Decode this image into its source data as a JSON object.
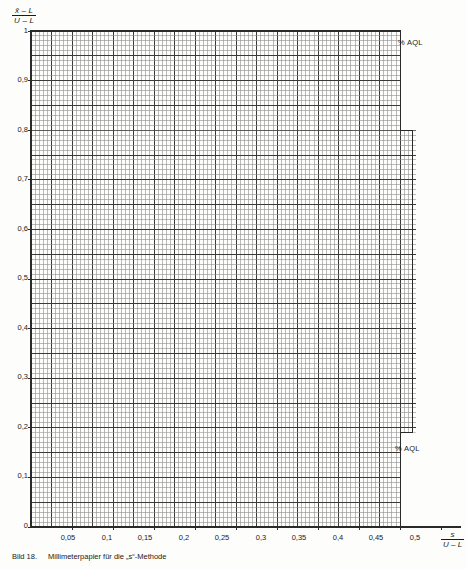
{
  "figure": {
    "caption_id": "Bild 18.",
    "caption_text": "Millimeterpapier für die „s“-Methode"
  },
  "axes": {
    "y_label": {
      "numerator": "x̄ – L",
      "denominator": "U – L"
    },
    "x_label": {
      "numerator": "s",
      "denominator": "U – L"
    },
    "y_ticks": [
      "1",
      "0,9",
      "0,8",
      "0,7",
      "0,6",
      "0,5",
      "0,4",
      "0,3",
      "0,2",
      "0,1",
      "0"
    ],
    "x_ticks": [
      "0,05",
      "0,1",
      "0,15",
      "0,2",
      "0,25",
      "0,3",
      "0,35",
      "0,4",
      "0,45",
      "0,5"
    ]
  },
  "annotations": {
    "aql_top": "% AQL",
    "aql_bottom": "% AQL"
  },
  "colors": {
    "background": "#fdfdfc",
    "grid_minor": "#8d8d8d",
    "grid_major": "#3a3a3a",
    "axis": "#2a2a2a",
    "text": "#1a1a1a"
  },
  "chart_data": {
    "type": "line",
    "title": "Millimeterpapier für die „s“-Methode",
    "subtitle": "",
    "xlabel": "s / (U – L)",
    "ylabel": "(x̄ – L) / (U – L)",
    "xlim": [
      0,
      0.5
    ],
    "ylim": [
      0,
      1
    ],
    "grid": true,
    "grid_minor_step_x": 0.005,
    "grid_minor_step_y": 0.01,
    "grid_major_step_x": 0.025,
    "grid_major_step_y": 0.05,
    "legend": "none",
    "xticks": [
      0.05,
      0.1,
      0.15,
      0.2,
      0.25,
      0.3,
      0.35,
      0.4,
      0.45,
      0.5
    ],
    "yticks": [
      0,
      0.1,
      0.2,
      0.3,
      0.4,
      0.5,
      0.6,
      0.7,
      0.8,
      0.9,
      1
    ],
    "series": [
      {
        "name": "grid-region-boundary",
        "description": "Stepped outline of the printed millimetre-grid area",
        "x": [
          0,
          0.45,
          0.45,
          0.465,
          0.465,
          0.45,
          0.45,
          0
        ],
        "y": [
          1,
          1,
          0.8,
          0.8,
          0.19,
          0.19,
          0,
          0
        ]
      }
    ],
    "annotations": [
      {
        "text": "% AQL",
        "x": 0.458,
        "y": 0.985
      },
      {
        "text": "% AQL",
        "x": 0.452,
        "y": 0.175
      }
    ]
  }
}
